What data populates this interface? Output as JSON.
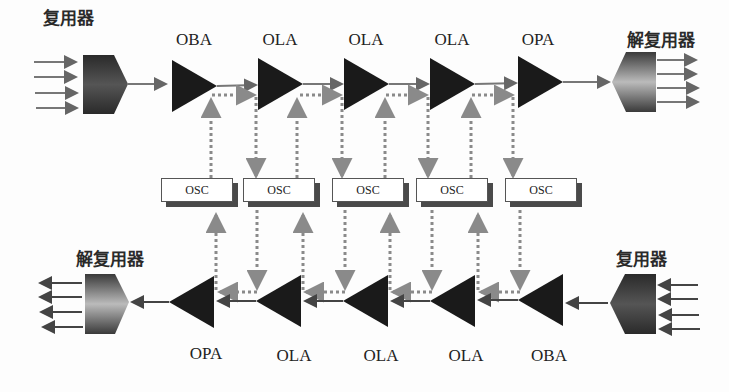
{
  "diagram": {
    "top_row": {
      "input_label": "复用器",
      "output_label": "解复用器",
      "amplifiers": [
        "OBA",
        "OLA",
        "OLA",
        "OLA",
        "OPA"
      ]
    },
    "bottom_row": {
      "input_label": "复用器",
      "output_label": "解复用器",
      "amplifiers": [
        "OPA",
        "OLA",
        "OLA",
        "OLA",
        "OBA"
      ]
    },
    "osc_boxes": [
      "OSC",
      "OSC",
      "OSC",
      "OSC",
      "OSC"
    ],
    "colors": {
      "amplifier": "#1a1a1a",
      "signal_line": "#666666",
      "supervisory_line": "#8a8a8a",
      "osc_shadow": "#4a4a4a"
    }
  }
}
